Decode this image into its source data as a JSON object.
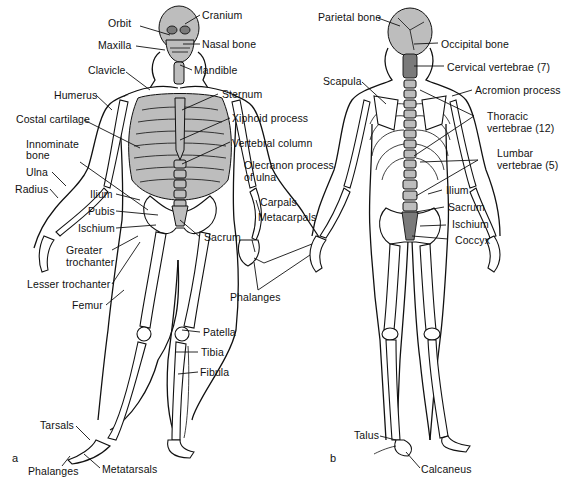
{
  "figure": {
    "panels": [
      {
        "id": "a",
        "view": "anterior",
        "letter": "a"
      },
      {
        "id": "b",
        "view": "posterior",
        "letter": "b"
      }
    ]
  },
  "labels_a": {
    "orbit": "Orbit",
    "cranium": "Cranium",
    "maxilla": "Maxilla",
    "nasal_bone": "Nasal bone",
    "clavicle": "Clavicle",
    "mandible": "Mandible",
    "humerus": "Humerus",
    "sternum": "Sternum",
    "costal_cartilage": "Costal cartilage",
    "xiphoid_process": "Xiphoid process",
    "innominate_bone_1": "Innominate",
    "innominate_bone_2": "bone",
    "vertebral_column": "Vertebral column",
    "ulna": "Ulna",
    "radius": "Radius",
    "ilium": "Ilium",
    "pubis": "Pubis",
    "ischium": "Ischium",
    "sacrum": "Sacrum",
    "greater_trochanter_1": "Greater",
    "greater_trochanter_2": "trochanter",
    "lesser_trochanter": "Lesser trochanter",
    "femur": "Femur",
    "patella": "Patella",
    "tibia": "Tibia",
    "fibula": "Fibula",
    "tarsals": "Tarsals",
    "phalanges_foot": "Phalanges",
    "metatarsals": "Metatarsals"
  },
  "labels_shared": {
    "olecranon_1": "Olecranon process",
    "olecranon_2": "of ulna",
    "carpals": "Carpals",
    "metacarpals": "Metacarpals",
    "phalanges_hand": "Phalanges"
  },
  "labels_b": {
    "parietal_bone": "Parietal bone",
    "occipital_bone": "Occipital bone",
    "cervical_vertebrae": "Cervical vertebrae (7)",
    "scapula": "Scapula",
    "acromion_process": "Acromion process",
    "thoracic_1": "Thoracic",
    "thoracic_2": "vertebrae (12)",
    "lumbar_1": "Lumbar",
    "lumbar_2": "vertebrae (5)",
    "ilium": "Ilium",
    "sacrum": "Sacrum",
    "ischium": "Ischium",
    "coccyx": "Coccyx",
    "talus": "Talus",
    "calcaneus": "Calcaneus"
  }
}
